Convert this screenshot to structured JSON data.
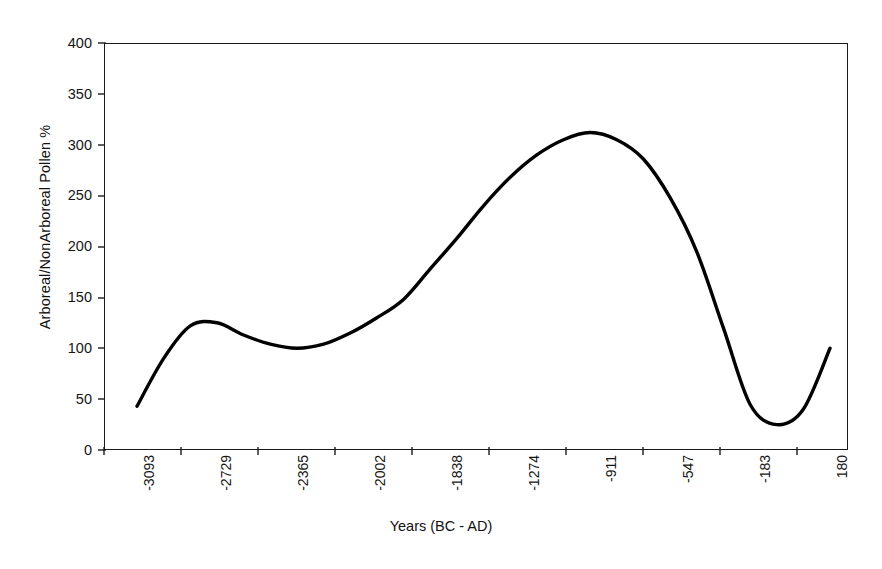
{
  "chart_data": {
    "type": "line",
    "title": "",
    "xlabel": "Years (BC - AD)",
    "ylabel": "Arboreal/NonArboreal Pollen %",
    "ylim": [
      0,
      400
    ],
    "y_ticks": [
      0,
      50,
      100,
      150,
      200,
      250,
      300,
      350,
      400
    ],
    "x_tick_labels": [
      "-3093",
      "-2729",
      "-2365",
      "-2002",
      "-1838",
      "-1274",
      "-911",
      "-547",
      "-183",
      "180"
    ],
    "grid": false,
    "legend": null,
    "series": [
      {
        "name": "Arboreal/NonArboreal Pollen %",
        "color": "#000000",
        "line_width": 3,
        "x": [
          "-3093",
          "-2860",
          "-2729",
          "-2600",
          "-2470",
          "-2365",
          "-2230",
          "-2100",
          "-2002",
          "-1920",
          "-1838",
          "-1700",
          "-1560",
          "-1420",
          "-1274",
          "-1150",
          "-1030",
          "-911",
          "-800",
          "-690",
          "-547",
          "-420",
          "-300",
          "-183",
          "-80",
          "30",
          "120"
        ],
        "values": [
          43,
          90,
          122,
          125,
          113,
          104,
          100,
          104,
          115,
          130,
          148,
          178,
          208,
          240,
          268,
          290,
          305,
          312,
          305,
          286,
          248,
          195,
          120,
          45,
          25,
          40,
          100
        ]
      }
    ],
    "points_read_from_axes": {
      "start": {
        "x_label": "-3093",
        "y": 43
      },
      "local_max": {
        "approx_x_label": "-2760",
        "y": 125
      },
      "local_min": {
        "approx_x_label": "-2290",
        "y": 100
      },
      "global_max": {
        "approx_x_label": "-1000",
        "y": 312
      },
      "global_min": {
        "approx_x_label": "-160",
        "y": 25
      },
      "end": {
        "approx_x_label": "160",
        "y": 174
      }
    }
  },
  "axes": {
    "y_title": "Arboreal/NonArboreal Pollen %",
    "x_title": "Years (BC - AD)",
    "y_labels": [
      "400",
      "350",
      "300",
      "250",
      "200",
      "150",
      "100",
      "50",
      "0"
    ],
    "x_labels": [
      "-3093",
      "-2729",
      "-2365",
      "-2002",
      "-1838",
      "-1274",
      "-911",
      "-547",
      "-183",
      "180"
    ]
  },
  "style": {
    "line_color": "#000000",
    "frame_color": "#1a1a1a",
    "background": "#ffffff",
    "text_color": "#151515"
  }
}
